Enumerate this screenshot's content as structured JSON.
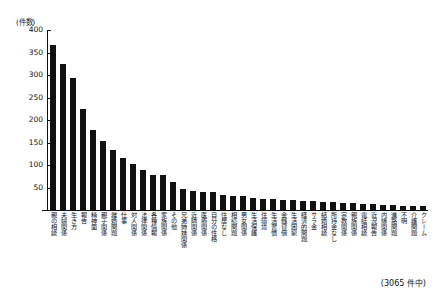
{
  "chart_data": {
    "type": "bar",
    "title": "",
    "subtitle": "",
    "xlabel": "",
    "ylabel": "(件数)",
    "ylim": [
      0,
      400
    ],
    "ytick_values": [
      0,
      50,
      100,
      150,
      200,
      250,
      300,
      350,
      400
    ],
    "ytick_labels": [
      "",
      "50",
      "100",
      "150",
      "200",
      "250",
      "300",
      "350",
      "400"
    ],
    "grid": false,
    "legend": null,
    "bar_color": "#111111",
    "categories": [
      "親の相談",
      "夫婦関係",
      "生き方",
      "報告",
      "精神面",
      "親子関係",
      "離婚問題",
      "仕事",
      "対人関係",
      "法律関係",
      "各種情報",
      "家族関係",
      "その他",
      "兄弟姉妹関係",
      "近隣関係",
      "医療関係",
      "自分の性格",
      "住居なし",
      "相続問題",
      "男女関係",
      "生活保護",
      "住環境",
      "生活習慣",
      "金銭貸借",
      "生活困窮",
      "経済的問題",
      "サラ金",
      "結婚相談",
      "所持金なし",
      "宗教関係",
      "親族関係",
      "電話相談",
      "近況報告",
      "内縁関係",
      "進路問題",
      "不明",
      "介護問題",
      "クレーム"
    ],
    "values": [
      366,
      324,
      294,
      224,
      178,
      154,
      134,
      115,
      102,
      88,
      78,
      78,
      62,
      47,
      42,
      41,
      41,
      33,
      32,
      31,
      27,
      25,
      24,
      23,
      22,
      21,
      20,
      18,
      17,
      16,
      15,
      14,
      13,
      12,
      11,
      10,
      9,
      8
    ]
  },
  "footer": {
    "total_note": "(3065 件中)"
  }
}
